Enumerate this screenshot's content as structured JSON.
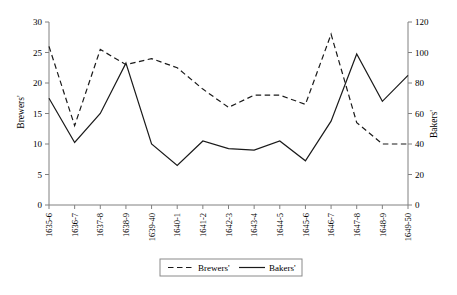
{
  "chart_data": {
    "type": "line",
    "title": "",
    "subtitle": "",
    "xlabel": "",
    "ylabel": "Brewers'",
    "y2label": "Bakers'",
    "ylim": [
      0,
      30
    ],
    "y2lim": [
      0,
      120
    ],
    "yticks": [
      0,
      5,
      10,
      15,
      20,
      25,
      30
    ],
    "y2ticks": [
      0,
      20,
      40,
      60,
      80,
      100,
      120
    ],
    "grid": false,
    "legend_position": "bottom",
    "categories": [
      "1635-6",
      "1636-7",
      "1637-8",
      "1638-9",
      "1639-40",
      "1640-1",
      "1641-2",
      "1642-3",
      "1643-4",
      "1644-5",
      "1645-6",
      "1646-7",
      "1647-8",
      "1648-9",
      "1649-50"
    ],
    "series": [
      {
        "name": "Brewers'",
        "axis": "left",
        "style": "dashed",
        "color": "#1a1a1a",
        "values": [
          26,
          13,
          25.5,
          23,
          24,
          22.5,
          19,
          16,
          18,
          18,
          16.5,
          28,
          13.5,
          10,
          10
        ]
      },
      {
        "name": "Bakers'",
        "axis": "right",
        "style": "solid",
        "color": "#1a1a1a",
        "values": [
          70,
          41,
          60,
          93,
          40,
          26,
          42,
          37,
          36,
          42,
          29,
          55,
          99,
          68,
          85
        ]
      }
    ],
    "legend": [
      {
        "label": "Brewers'",
        "style": "dashed"
      },
      {
        "label": "Bakers'",
        "style": "solid"
      }
    ]
  }
}
